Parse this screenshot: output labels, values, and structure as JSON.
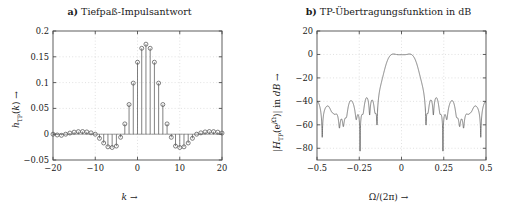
{
  "figure": {
    "width": 518,
    "height": 213,
    "background": "#ffffff",
    "line_color": "#555555",
    "grid_color": "#cccccc",
    "axis_color": "#4d4d4d"
  },
  "panels": [
    {
      "id": "a",
      "tag": "a)",
      "title": "a) Tiefpaß-Impulsantwort",
      "title_text": "Tiefpaß-Impulsantwort",
      "xlabel": "k →",
      "ylabel": "h_TP(k) →"
    },
    {
      "id": "b",
      "tag": "b)",
      "title": "b) TP-Übertragungsfunktion in dB",
      "title_text": "TP-Übertragungsfunktion in dB",
      "xlabel": "Ω/(2π) →",
      "ylabel": "|H_TP(e^{jΩ})| in dB →"
    }
  ],
  "chart_data": [
    {
      "type": "scatter",
      "style": "stem",
      "title": "a) Tiefpaß-Impulsantwort",
      "xlabel": "k →",
      "ylabel": "h_TP(k) →",
      "xlim": [
        -20,
        20
      ],
      "ylim": [
        -0.05,
        0.2
      ],
      "xticks": [
        -20,
        -10,
        0,
        10,
        20
      ],
      "xticklabels": [
        "-20",
        "-10",
        "0",
        "10",
        "20"
      ],
      "yticks": [
        -0.05,
        0,
        0.05,
        0.1,
        0.15,
        0.2
      ],
      "yticklabels": [
        "-0.05",
        "0",
        "0.05",
        "0.1",
        "0.15",
        "0.2"
      ],
      "grid": true,
      "marker": "o",
      "x": [
        -20,
        -19,
        -18,
        -17,
        -16,
        -15,
        -14,
        -13,
        -12,
        -11,
        -10,
        -9,
        -8,
        -7,
        -6,
        -5,
        -4,
        -3,
        -2,
        -1,
        0,
        1,
        2,
        3,
        4,
        5,
        6,
        7,
        8,
        9,
        10,
        11,
        12,
        13,
        14,
        15,
        16,
        17,
        18,
        19,
        20
      ],
      "values": [
        0.0,
        -0.0015,
        -0.0022,
        0.0,
        0.0022,
        0.004,
        0.005,
        0.0052,
        0.0044,
        0.0026,
        0.0,
        -0.008,
        -0.017,
        -0.0245,
        -0.0258,
        -0.023,
        -0.006,
        0.02,
        0.0575,
        0.099,
        0.1395,
        0.1665,
        0.1745,
        0.1665,
        0.1395,
        0.099,
        0.0575,
        0.02,
        -0.006,
        -0.023,
        -0.0258,
        -0.0245,
        -0.017,
        -0.008,
        0.0,
        0.0026,
        0.0044,
        0.0052,
        0.005,
        0.004,
        0.0022
      ],
      "note": "symmetric windowed-sinc lowpass impulse response centered at k=0, peak 0.175"
    },
    {
      "type": "line",
      "title": "b) TP-Übertragungsfunktion in dB",
      "xlabel": "Ω/(2π) →",
      "ylabel": "|H_TP(e^{jΩ})| in dB →",
      "xlim": [
        -0.5,
        0.5
      ],
      "ylim": [
        -90,
        20
      ],
      "xticks": [
        -0.5,
        -0.25,
        0,
        0.25,
        0.5
      ],
      "xticklabels": [
        "-0.5",
        "-0.25",
        "0",
        "0.25",
        "0.5"
      ],
      "yticks": [
        -80,
        -60,
        -40,
        -20,
        0,
        20
      ],
      "yticklabels": [
        "-80",
        "-60",
        "-40",
        "-20",
        "0",
        "20"
      ],
      "grid": true,
      "passband_edge": 0.06,
      "stopband_edge": 0.125,
      "passband_level_db": 0,
      "stopband_peak_db": -53,
      "stopband_null_db": -85,
      "ripple_count_per_side": 16,
      "note": "magnitude response in dB of the windowed-sinc lowpass; flat 0 dB passband to ~0.06, steep transition, equiripple-like stopband lobes peaking near -53 dB"
    }
  ]
}
